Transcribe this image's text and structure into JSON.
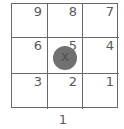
{
  "grid": {
    "rows": [
      [
        {
          "label": "9"
        },
        {
          "label": "8"
        },
        {
          "label": "7"
        }
      ],
      [
        {
          "label": "6"
        },
        {
          "label": "5"
        },
        {
          "label": "4"
        }
      ],
      [
        {
          "label": "3"
        },
        {
          "label": "2"
        },
        {
          "label": "1"
        }
      ]
    ]
  },
  "marker": {
    "label": "X",
    "cell": "5",
    "color": "#707070"
  },
  "bottom_label": "1",
  "colors": {
    "line": "#6a6a6a",
    "text": "#5a5a5a",
    "background": "#ffffff"
  }
}
